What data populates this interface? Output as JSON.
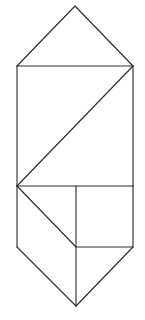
{
  "diagram": {
    "type": "geometric-figure",
    "stroke_color": "#2a2a2a",
    "background_color": "#ffffff",
    "vertices": {
      "top_apex": [
        75,
        6
      ],
      "upper_left": [
        17,
        66
      ],
      "upper_right": [
        133,
        66
      ],
      "mid_left": [
        17,
        186
      ],
      "mid_right": [
        133,
        186
      ],
      "mid_divider_top": [
        76,
        186
      ],
      "inner_center": [
        76,
        247
      ],
      "lower_left": [
        17,
        247
      ],
      "lower_right": [
        133,
        247
      ],
      "bottom_apex": [
        76,
        306
      ]
    },
    "segments": [
      {
        "id": "top-left-roof",
        "from": "top_apex",
        "to": "upper_left"
      },
      {
        "id": "top-right-roof",
        "from": "top_apex",
        "to": "upper_right"
      },
      {
        "id": "upper-horizontal",
        "from": "upper_left",
        "to": "upper_right"
      },
      {
        "id": "left-upper-side",
        "from": "upper_left",
        "to": "mid_left"
      },
      {
        "id": "right-upper-side",
        "from": "upper_right",
        "to": "mid_right"
      },
      {
        "id": "upper-diagonal",
        "from": "upper_right",
        "to": "mid_left"
      },
      {
        "id": "middle-horizontal",
        "from": "mid_left",
        "to": "mid_right"
      },
      {
        "id": "lower-diagonal",
        "from": "mid_left",
        "to": "inner_center"
      },
      {
        "id": "vertical-divider",
        "from": "mid_divider_top",
        "to": "bottom_apex"
      },
      {
        "id": "inner-horizontal",
        "from": "inner_center",
        "to": "lower_right"
      },
      {
        "id": "left-lower-side",
        "from": "mid_left",
        "to": "lower_left"
      },
      {
        "id": "right-lower-side",
        "from": "mid_right",
        "to": "lower_right"
      },
      {
        "id": "bottom-left-edge",
        "from": "lower_left",
        "to": "bottom_apex"
      },
      {
        "id": "bottom-right-edge",
        "from": "lower_right",
        "to": "bottom_apex"
      }
    ]
  }
}
